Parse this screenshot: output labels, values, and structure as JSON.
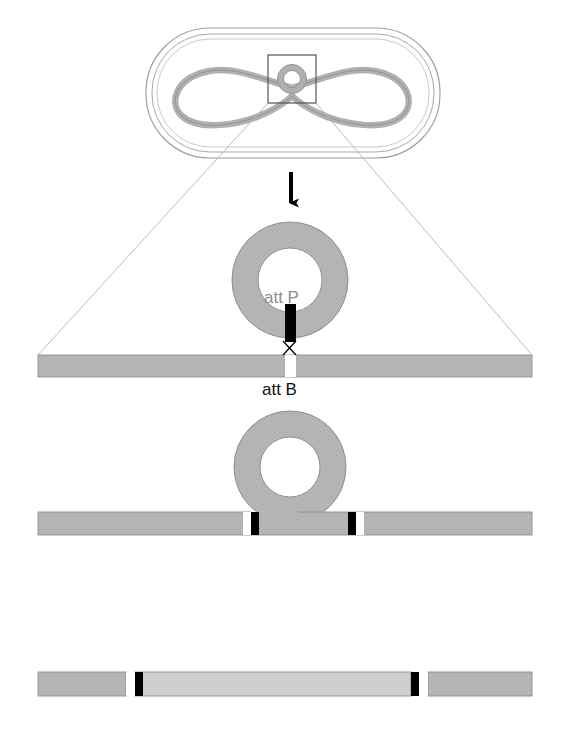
{
  "figure": {
    "background_color": "#ffffff",
    "width": 569,
    "height": 743
  },
  "colors": {
    "chromosome_grey": "#b3b3b3",
    "chromosome_stroke": "#8c8c8c",
    "phage_grey": "#b8b8b8",
    "phage_stroke": "#8c8c8c",
    "integrated_phage_grey": "#cfcfcf",
    "att_black": "#000000",
    "att_white": "#ffffff",
    "cell_outline": "#9a9a9a",
    "guide_line": "#b0b0b0",
    "arrow_black": "#000000",
    "attp_text": "#8e8e8e",
    "attb_text": "#111111"
  },
  "labels": {
    "att_p": "att P",
    "att_b": "att B"
  },
  "stages": {
    "cell": {
      "name": "bacterial-cell-with-phage",
      "capsule": {
        "x": 148,
        "y": 30,
        "width": 290,
        "height": 126,
        "radius": 62
      },
      "inset_box": {
        "x": 268,
        "y": 55,
        "width": 48,
        "height": 48
      },
      "phage_circle": {
        "cx": 292,
        "cy": 79,
        "r_outer": 15,
        "r_inner": 8
      }
    },
    "arrow": {
      "name": "down-arrow",
      "x": 291,
      "y_top": 172,
      "y_bottom": 212
    },
    "stage1": {
      "name": "phage-circle-aligned-to-chromosome",
      "ring": {
        "cx": 290,
        "cy": 280,
        "r_outer": 58,
        "r_inner": 32
      },
      "bar": {
        "x": 38,
        "y": 355,
        "width": 494,
        "height": 22
      },
      "attP_mark": {
        "x": 285,
        "y": 305,
        "width": 11,
        "height": 36
      },
      "attB_gap": {
        "x": 285,
        "y": 355,
        "width": 11,
        "height": 22
      },
      "crossover": {
        "cx": 290,
        "cy": 348,
        "size": 9
      }
    },
    "stage2": {
      "name": "phage-integrated-into-chromosome",
      "ring": {
        "cx": 290,
        "cy": 467,
        "r_outer": 56,
        "r_inner": 30
      },
      "bar": {
        "x": 38,
        "y": 512,
        "width": 494,
        "height": 23
      },
      "marks_left": [
        {
          "type": "white",
          "x": 243,
          "width": 8
        },
        {
          "type": "black",
          "x": 251,
          "width": 8
        }
      ],
      "marks_right": [
        {
          "type": "black",
          "x": 348,
          "width": 8
        },
        {
          "type": "white",
          "x": 356,
          "width": 8
        }
      ]
    },
    "stage3": {
      "name": "final-integrated-chromosome",
      "bar": {
        "x": 38,
        "y": 672,
        "width": 494,
        "height": 24
      },
      "integrated_segment": {
        "x": 136,
        "y": 672,
        "width": 281,
        "height": 24
      },
      "marks_left": [
        {
          "type": "white",
          "x": 126,
          "width": 9
        },
        {
          "type": "black",
          "x": 135,
          "width": 8
        }
      ],
      "marks_right": [
        {
          "type": "black",
          "x": 411,
          "width": 8
        },
        {
          "type": "white",
          "x": 419,
          "width": 9
        }
      ]
    },
    "guides": {
      "name": "perspective-guide-lines",
      "left": {
        "x1": 268,
        "y1": 103,
        "x2": 38,
        "y2": 355
      },
      "right": {
        "x1": 316,
        "y1": 103,
        "x2": 532,
        "y2": 355
      }
    }
  }
}
